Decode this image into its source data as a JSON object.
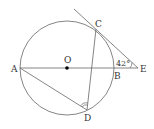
{
  "diagram": {
    "type": "geometry-circle-tangent",
    "points": {
      "A": {
        "label": "A",
        "x": 20,
        "y": 68
      },
      "O": {
        "label": "O",
        "x": 67,
        "y": 68
      },
      "B": {
        "label": "B",
        "x": 115,
        "y": 68
      },
      "C": {
        "label": "C",
        "x": 96,
        "y": 29
      },
      "D": {
        "label": "D",
        "x": 87,
        "y": 110
      },
      "E": {
        "label": "E",
        "x": 138,
        "y": 68
      }
    },
    "circle": {
      "center": "O",
      "radius": 47
    },
    "segments": [
      "A-E",
      "C-D",
      "A-D",
      "tangent-through-C-to-E"
    ],
    "angle_label": "42°",
    "angle_at": "E",
    "marked_angle_at": "D",
    "colors": {
      "line": "#555555",
      "point": "#000000",
      "background": "#ffffff"
    }
  }
}
